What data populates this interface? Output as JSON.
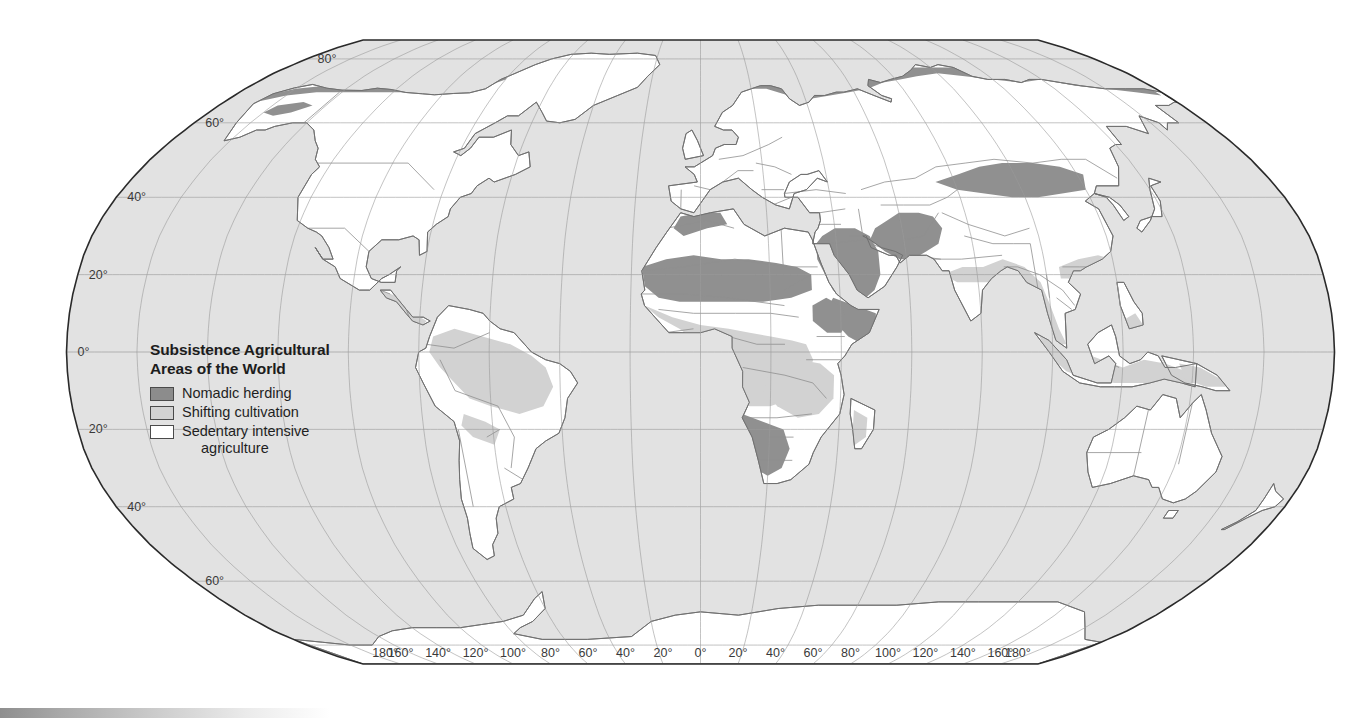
{
  "map": {
    "projection": "robinson",
    "ocean_color": "#e2e2e2",
    "graticule_color": "#9a9a9a",
    "border_color": "#2a2a2a",
    "country_border_color": "#8a8a8a",
    "coastline_color": "#6f6f6f",
    "background_color": "#ffffff"
  },
  "legend": {
    "title_line1": "Subsistence Agricultural",
    "title_line2": "Areas of the World",
    "items": [
      {
        "label": "Nomadic herding",
        "color": "#8c8c8c",
        "key": "nomadic-herding"
      },
      {
        "label": "Shifting cultivation",
        "color": "#d2d2d2",
        "key": "shifting-cultivation"
      },
      {
        "label": "Sedentary intensive",
        "color": "#ffffff",
        "key": "sedentary-intensive",
        "continuation": "agriculture"
      }
    ]
  },
  "graticule": {
    "latitude_labels": [
      "80°",
      "60°",
      "40°",
      "20°",
      "0°",
      "20°",
      "40°",
      "60°"
    ],
    "latitude_values": [
      80,
      60,
      40,
      20,
      0,
      -20,
      -40,
      -60
    ],
    "longitude_labels": [
      "180°",
      "160°",
      "140°",
      "120°",
      "100°",
      "80°",
      "60°",
      "40°",
      "20°",
      "0°",
      "20°",
      "40°",
      "60°",
      "80°",
      "100°",
      "120°",
      "140°",
      "160°",
      "180°"
    ],
    "longitude_values": [
      -180,
      -160,
      -140,
      -120,
      -100,
      -80,
      -60,
      -40,
      -20,
      0,
      20,
      40,
      60,
      80,
      100,
      120,
      140,
      160,
      180
    ],
    "label_color": "#3a3a3a",
    "lat_spacing_deg": 20,
    "lon_spacing_deg": 20
  },
  "chart_data": {
    "type": "map",
    "title": "Subsistence Agricultural Areas of the World",
    "categories": [
      "Nomadic herding",
      "Shifting cultivation",
      "Sedentary intensive agriculture"
    ],
    "regions": [
      {
        "category": "Nomadic herding",
        "areas": [
          "Sahara and Sahel belt of Africa",
          "Arabian Peninsula",
          "Horn of Africa and Somalia",
          "Iran and Afghanistan",
          "Mongolia and Central Asia steppe",
          "Tibetan Plateau margins",
          "Arctic northern Scandinavia and Siberia",
          "Northern Alaska and Canadian Arctic",
          "Southwest Africa Namibia and Botswana"
        ]
      },
      {
        "category": "Shifting cultivation",
        "areas": [
          "Amazon Basin of South America",
          "Central Africa Congo Basin",
          "West African coastal forest",
          "Southeast Asia and Indonesia",
          "India and Indochina",
          "Southern China",
          "New Guinea",
          "Madagascar interior",
          "Central America forest"
        ]
      },
      {
        "category": "Sedentary intensive agriculture",
        "areas": [
          "North America",
          "Europe",
          "Siberia",
          "Eastern China plains",
          "Northern India Ganges",
          "Australia",
          "Southern South America",
          "Antarctica",
          "Japan"
        ]
      }
    ]
  }
}
